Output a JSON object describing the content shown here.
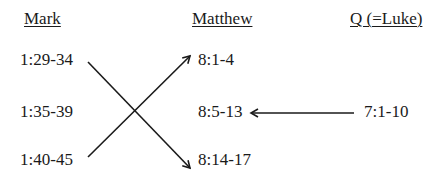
{
  "headers": {
    "mark": "Mark",
    "matthew": "Matthew",
    "q": "Q (=Luke)"
  },
  "mark": [
    "1:29-34",
    "1:35-39",
    "1:40-45"
  ],
  "matthew": [
    "8:1-4",
    "8:5-13",
    "8:14-17"
  ],
  "q": [
    "7:1-10"
  ],
  "arrows": [
    {
      "from": "Mark 1:29-34",
      "to": "Matthew 8:14-17"
    },
    {
      "from": "Mark 1:40-45",
      "to": "Matthew 8:1-4"
    },
    {
      "from": "Q 7:1-10",
      "to": "Matthew 8:5-13"
    }
  ]
}
